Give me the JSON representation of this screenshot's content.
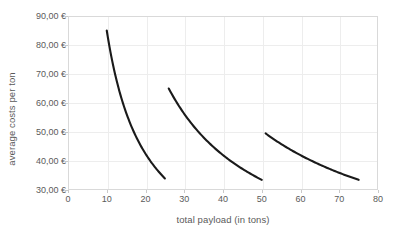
{
  "chart_data": {
    "type": "line",
    "title": "",
    "xlabel": "total payload (in tons)",
    "ylabel": "average costs per ton",
    "xlim": [
      0,
      80
    ],
    "ylim": [
      30,
      90
    ],
    "xticks": [
      0,
      10,
      20,
      30,
      40,
      50,
      60,
      70,
      80
    ],
    "xtick_labels": [
      "0",
      "10",
      "20",
      "30",
      "40",
      "50",
      "60",
      "70",
      "80"
    ],
    "yticks": [
      30,
      40,
      50,
      60,
      70,
      80,
      90
    ],
    "ytick_labels": [
      "30,00 €",
      "40,00 €",
      "50,00 €",
      "60,00 €",
      "70,00 €",
      "80,00 €",
      "90,00 €"
    ],
    "grid": true,
    "legend": "none",
    "line_color": "#1a1a1a",
    "grid_color": "#ededed",
    "axis_color": "#d9d9d9",
    "text_color": "#5a5a5a",
    "background": "#ffffff",
    "series": [
      {
        "name": "segment-1",
        "x": [
          10,
          11,
          12,
          13,
          14,
          15,
          16,
          17,
          18,
          19,
          20,
          21,
          22,
          23,
          24,
          25
        ],
        "values": [
          85.0,
          77.9,
          72.1,
          67.4,
          63.4,
          60.0,
          57.1,
          54.6,
          52.4,
          50.4,
          48.7,
          47.2,
          45.8,
          44.5,
          43.4,
          42.3
        ],
        "y_end_observed": 34.0,
        "x_start": 10,
        "x_end": 25,
        "y_start": 85.0,
        "y_end": 34.0
      },
      {
        "name": "segment-2",
        "x": [
          26,
          29,
          32,
          35,
          38,
          41,
          44,
          47,
          50
        ],
        "values": [
          65.0,
          60.0,
          55.8,
          52.3,
          49.4,
          46.9,
          44.7,
          42.8,
          41.1
        ],
        "x_start": 26,
        "x_end": 50,
        "y_start": 65.0,
        "y_end": 33.5
      },
      {
        "name": "segment-3",
        "x": [
          51,
          54,
          57,
          60,
          63,
          66,
          69,
          72,
          75
        ],
        "values": [
          49.5,
          47.4,
          45.5,
          43.8,
          42.3,
          40.9,
          39.7,
          38.5,
          37.5
        ],
        "x_start": 51,
        "x_end": 75,
        "y_start": 49.5,
        "y_end": 33.5
      }
    ],
    "curve_paths": {
      "segment_1": "M 38.75,4.67 C 44.0,29.0 50.0,52.0 58.0,72.0 C 68.0,97.0 80.0,124.0 92.0,145.0 C 97.0,154.0 102.0,161.0 96.88,162.67",
      "segment_2": "M 100.75,46.33 C 110.0,63.0 120.0,82.0 132.0,102.0 C 144.0,122.0 160.0,145.0 177.0,158.0 C 183.0,163.0 190.0,166.0 193.75,169.33",
      "segment_3": "M 197.63,113.17 C 212.0,122.0 228.0,134.0 244.0,145.0 C 258.0,154.0 272.0,162.0 283.0,166.0 C 287.0,168.0 290.0,169.0 290.63,169.33"
    }
  }
}
